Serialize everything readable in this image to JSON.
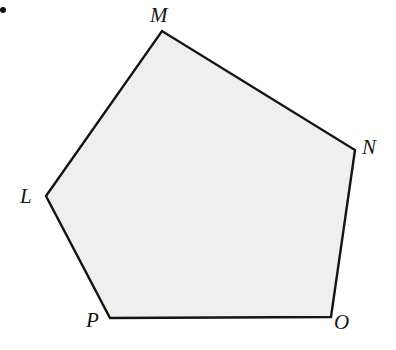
{
  "figure": {
    "canvas": {
      "width": 396,
      "height": 350,
      "background": "#ffffff"
    },
    "bullet_marker": {
      "name": "list-bullet",
      "x": 0,
      "y": 7,
      "size": 6,
      "color": "#101010"
    },
    "polygon": {
      "name": "pentagon-LMNOP",
      "sides": 5,
      "fill": "#efefef",
      "stroke": "#141414",
      "stroke_width": 2.4,
      "points": "46,196 162,31 355,150 331,317 110,318",
      "vertices": [
        {
          "id": "L",
          "label": "L",
          "x": 46,
          "y": 196,
          "label_x": 20,
          "label_y": 186
        },
        {
          "id": "M",
          "label": "M",
          "x": 162,
          "y": 31,
          "label_x": 150,
          "label_y": 5
        },
        {
          "id": "N",
          "label": "N",
          "x": 355,
          "y": 150,
          "label_x": 362,
          "label_y": 137
        },
        {
          "id": "O",
          "label": "O",
          "x": 331,
          "y": 317,
          "label_x": 334,
          "label_y": 312
        },
        {
          "id": "P",
          "label": "P",
          "x": 110,
          "y": 318,
          "label_x": 86,
          "label_y": 310
        }
      ],
      "edges": [
        {
          "from": "L",
          "to": "M"
        },
        {
          "from": "M",
          "to": "N"
        },
        {
          "from": "N",
          "to": "O"
        },
        {
          "from": "O",
          "to": "P"
        },
        {
          "from": "P",
          "to": "L"
        }
      ]
    }
  }
}
